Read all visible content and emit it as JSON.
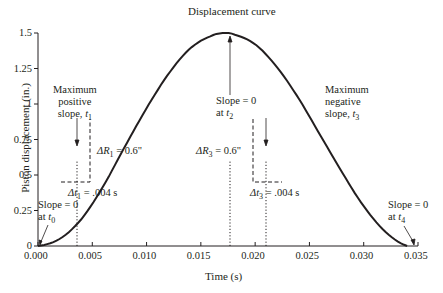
{
  "chart_data": {
    "type": "line",
    "title": "Displacement curve",
    "xlabel": "Time (s)",
    "ylabel": "Piston displacement (in.)",
    "xlim": [
      0,
      0.035
    ],
    "ylim": [
      0,
      1.5
    ],
    "x_ticks": [
      "0.000",
      "0.005",
      "0.010",
      "0.015",
      "0.020",
      "0.025",
      "0.030",
      "0.035"
    ],
    "y_ticks": [
      "0",
      "0.25",
      "0.5",
      "0.75",
      "1",
      "1.25",
      "1.5"
    ],
    "grid": false,
    "legend": null,
    "series": [
      {
        "name": "Displacement curve",
        "x": [
          0.0,
          0.002,
          0.004,
          0.006,
          0.008,
          0.01,
          0.012,
          0.014,
          0.016,
          0.0172,
          0.018,
          0.02,
          0.022,
          0.024,
          0.026,
          0.028,
          0.03,
          0.032,
          0.034
        ],
        "y": [
          0.0,
          0.05,
          0.19,
          0.42,
          0.7,
          0.97,
          1.21,
          1.39,
          1.48,
          1.5,
          1.49,
          1.42,
          1.26,
          1.04,
          0.78,
          0.52,
          0.28,
          0.1,
          0.0
        ]
      }
    ],
    "annotations": [
      {
        "text": "Slope = 0 at t0",
        "x": 0.0,
        "y": 0.0
      },
      {
        "text": "Maximum positive slope, t1",
        "x": 0.0077,
        "y": 0.65
      },
      {
        "text": "ΔR1 = 0.6\"",
        "x": 0.0097,
        "y": 0.75
      },
      {
        "text": "Δt1 = .004 s",
        "x": 0.0077,
        "y": 0.5
      },
      {
        "text": "Slope = 0 at t2",
        "x": 0.0172,
        "y": 1.5
      },
      {
        "text": "Maximum negative slope, t3",
        "x": 0.0268,
        "y": 0.65
      },
      {
        "text": "ΔR3 = 0.6\"",
        "x": 0.0255,
        "y": 0.75
      },
      {
        "text": "Δt3 = .004 s",
        "x": 0.0268,
        "y": 0.35
      },
      {
        "text": "Slope = 0 at t4",
        "x": 0.034,
        "y": 0.0
      }
    ]
  },
  "labels": {
    "title": "Displacement curve",
    "xlabel": "Time (s)",
    "ylabel": "Piston displacement (in.)",
    "ann_t0_line1": "Slope = 0",
    "ann_t0_line2": "at ",
    "ann_t0_var": "t",
    "ann_t0_sub": "0",
    "ann_t1_line1": "Maximum",
    "ann_t1_line2": "positive",
    "ann_t1_line3": "slope, ",
    "ann_t1_var": "t",
    "ann_t1_sub": "1",
    "ann_dr1": " = 0.6\"",
    "ann_dr1_var": "ΔR",
    "ann_dr1_sub": "1",
    "ann_dt1": " = .004 s",
    "ann_dt1_var": "Δt",
    "ann_dt1_sub": "1",
    "ann_t2_line1": "Slope = 0",
    "ann_t2_line2": "at ",
    "ann_t2_var": "t",
    "ann_t2_sub": "2",
    "ann_t3_line1": "Maximum",
    "ann_t3_line2": "negative",
    "ann_t3_line3": "slope, ",
    "ann_t3_var": "t",
    "ann_t3_sub": "3",
    "ann_dr3": " = 0.6\"",
    "ann_dr3_var": "ΔR",
    "ann_dr3_sub": "3",
    "ann_dt3": " = .004 s",
    "ann_dt3_var": "Δt",
    "ann_dt3_sub": "3",
    "ann_t4_line1": "Slope = 0",
    "ann_t4_line2": "at ",
    "ann_t4_var": "t",
    "ann_t4_sub": "4"
  }
}
